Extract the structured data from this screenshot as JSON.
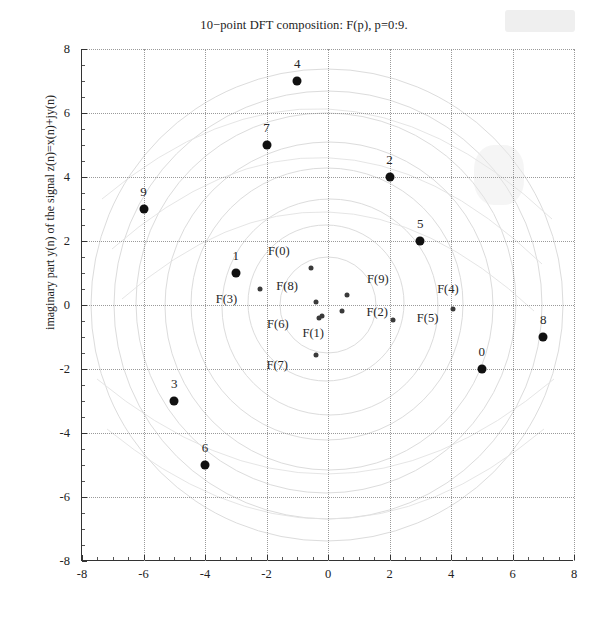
{
  "figure": {
    "title": "10−point DFT composition: F(p), p=0:9.",
    "ylabel": "imaginary part y(n) of the signal z(n)=x(n)+jy(n)",
    "xlabel": ""
  },
  "chart_data": {
    "type": "scatter",
    "title": "10−point DFT composition: F(p), p=0:9.",
    "xlabel": "",
    "ylabel": "imaginary part y(n) of the signal z(n)=x(n)+jy(n)",
    "xlim": [
      -8,
      8
    ],
    "ylim": [
      -8,
      8
    ],
    "xticks": [
      -8,
      -6,
      -4,
      -2,
      0,
      2,
      4,
      6,
      8
    ],
    "yticks": [
      -8,
      -6,
      -4,
      -2,
      0,
      2,
      4,
      6,
      8
    ],
    "xticklabels": [
      "-8",
      "-6",
      "-4",
      "-2",
      "0",
      "2",
      "4",
      "6",
      "8"
    ],
    "yticklabels": [
      "-8",
      "-6",
      "-4",
      "-2",
      "0",
      "2",
      "4",
      "6",
      "8"
    ],
    "grid": true,
    "grid_style": "dotted",
    "legend": "none",
    "marker_color": "#111111",
    "series": [
      {
        "name": "signal samples z(n)",
        "marker": "filled-circle-large",
        "label_position": "above",
        "points": [
          {
            "label": "0",
            "x": 5,
            "y": -2
          },
          {
            "label": "1",
            "x": -3,
            "y": 1
          },
          {
            "label": "2",
            "x": 2,
            "y": 4
          },
          {
            "label": "3",
            "x": -5,
            "y": -3
          },
          {
            "label": "4",
            "x": -1,
            "y": 7
          },
          {
            "label": "5",
            "x": 3,
            "y": 2
          },
          {
            "label": "6",
            "x": -4,
            "y": -5
          },
          {
            "label": "7",
            "x": -2,
            "y": 5
          },
          {
            "label": "8",
            "x": 7,
            "y": -1
          },
          {
            "label": "9",
            "x": -6,
            "y": 3
          }
        ]
      },
      {
        "name": "DFT coefficients F(p)",
        "marker": "filled-circle-small",
        "label_position": "left",
        "points": [
          {
            "label": "F(0)",
            "x": -0.55,
            "y": 1.15,
            "label_dx": -1.05,
            "label_dy": 0.55
          },
          {
            "label": "F(1)",
            "x": -0.18,
            "y": -0.33,
            "label_dx": -0.3,
            "label_dy": -0.55
          },
          {
            "label": "F(2)",
            "x": 0.45,
            "y": -0.2,
            "label_dx": 1.15,
            "label_dy": -0.02
          },
          {
            "label": "F(3)",
            "x": -2.2,
            "y": 0.5,
            "label_dx": -1.1,
            "label_dy": -0.3
          },
          {
            "label": "F(4)",
            "x": 4.05,
            "y": -0.12,
            "label_dx": -0.15,
            "label_dy": 0.62
          },
          {
            "label": "F(5)",
            "x": 2.12,
            "y": -0.48,
            "label_dx": 1.12,
            "label_dy": 0.08
          },
          {
            "label": "F(6)",
            "x": -0.28,
            "y": -0.42,
            "label_dx": -1.35,
            "label_dy": -0.18
          },
          {
            "label": "F(7)",
            "x": -0.4,
            "y": -1.55,
            "label_dx": -1.25,
            "label_dy": -0.33
          },
          {
            "label": "F(8)",
            "x": -0.38,
            "y": 0.08,
            "label_dx": -0.95,
            "label_dy": 0.52
          },
          {
            "label": "F(9)",
            "x": 0.62,
            "y": 0.32,
            "label_dx": 1.0,
            "label_dy": 0.5
          }
        ]
      }
    ],
    "arcs": {
      "description": "faint concentric spiral/arc construction curves centered near origin",
      "count": 9,
      "color": "#dedede"
    }
  }
}
